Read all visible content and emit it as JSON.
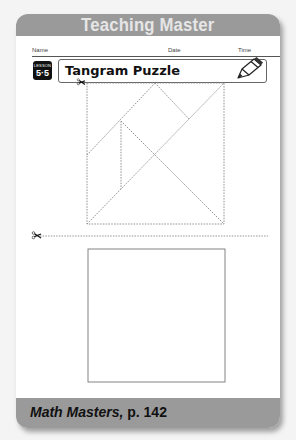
{
  "header": {
    "title": "Teaching Master"
  },
  "fields": {
    "name_label": "Name",
    "date_label": "Date",
    "time_label": "Time"
  },
  "lesson": {
    "label": "LESSON",
    "number": "5·5"
  },
  "title": "Tangram Puzzle",
  "icons": {
    "pencil": "pencil-icon",
    "scissors": "scissors-icon"
  },
  "footer": {
    "source": "Math Masters,",
    "page": " p. 142"
  },
  "colors": {
    "banner": "#9a9a9a",
    "banner_text": "#e6e6e6",
    "badge": "#111111"
  }
}
